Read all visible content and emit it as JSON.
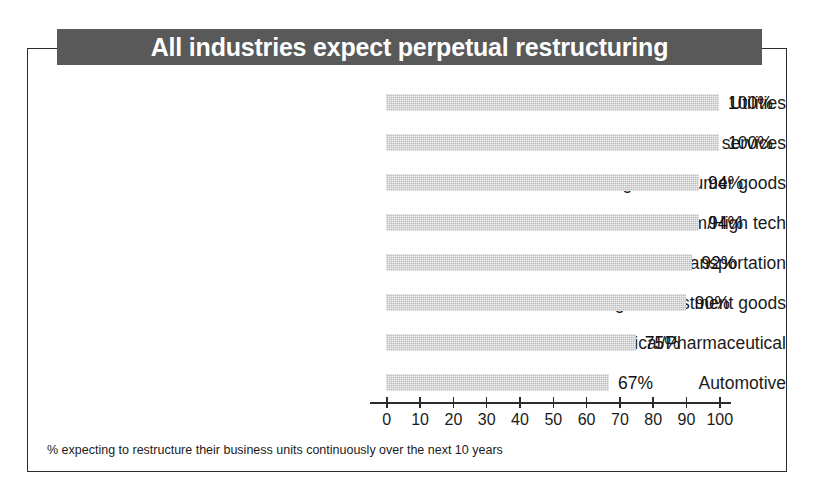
{
  "title": "All industries expect perpetual restructuring",
  "footnote": "% expecting to restructure their business units continuously over the next 10 years",
  "colors": {
    "title_bar_bg": "#595959",
    "title_text": "#ffffff",
    "bar_fill": "#b9b9b9",
    "frame_border": "#2b2b2b",
    "text": "#1b1b1b",
    "page_bg": "#ffffff"
  },
  "chart_data": {
    "type": "bar",
    "orientation": "horizontal",
    "title": "All industries expect perpetual restructuring",
    "subtitle": "",
    "xlabel": "",
    "ylabel": "",
    "xlim": [
      0,
      100
    ],
    "grid": false,
    "legend": "none",
    "annotation": "% expecting to restructure their business units continuously over the next 10 years",
    "xticks": [
      0,
      10,
      20,
      30,
      40,
      50,
      60,
      70,
      80,
      90,
      100
    ],
    "xtick_labels": [
      "0",
      "10",
      "20",
      "30",
      "40",
      "50",
      "60",
      "70",
      "80",
      "90",
      "100"
    ],
    "categories": [
      "Utilities",
      "Financial services",
      "Manufacturing of consumer goods",
      "Telecom/High tech",
      "Transportation",
      "Manufacturing of investment goods",
      "Chemical/Pharmaceutical",
      "Automotive"
    ],
    "values": [
      100,
      100,
      94,
      94,
      92,
      90,
      75,
      67
    ],
    "value_labels": [
      "100%",
      "100%",
      "94%",
      "94%",
      "92%",
      "90%",
      "75%",
      "67%"
    ]
  }
}
